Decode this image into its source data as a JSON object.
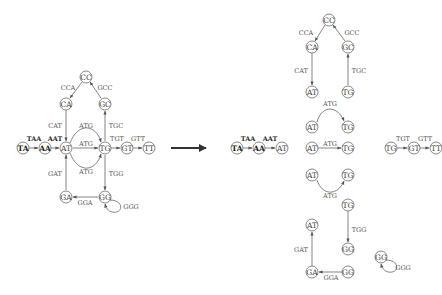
{
  "figure": {
    "type": "de Bruijn graph decomposition",
    "transform_arrow": "right-arrow"
  },
  "left_graph": {
    "nodes": [
      {
        "id": "TA",
        "label": "TA",
        "x": 23,
        "y": 148,
        "bold": true
      },
      {
        "id": "AA",
        "label": "AA",
        "x": 45,
        "y": 148,
        "bold": true
      },
      {
        "id": "AT",
        "label": "AT",
        "x": 66,
        "y": 148
      },
      {
        "id": "TG",
        "label": "TG",
        "x": 105,
        "y": 148
      },
      {
        "id": "GT",
        "label": "GT",
        "x": 127,
        "y": 148
      },
      {
        "id": "TT",
        "label": "TT",
        "x": 149,
        "y": 148
      },
      {
        "id": "CC",
        "label": "CC",
        "x": 86,
        "y": 77
      },
      {
        "id": "CA",
        "label": "CA",
        "x": 66,
        "y": 104
      },
      {
        "id": "GC",
        "label": "GC",
        "x": 105,
        "y": 104
      },
      {
        "id": "GA",
        "label": "GA",
        "x": 66,
        "y": 197
      },
      {
        "id": "GG",
        "label": "GG",
        "x": 105,
        "y": 197
      }
    ],
    "edges": [
      {
        "from": "TA",
        "to": "AA",
        "label": "TAA",
        "bold": true
      },
      {
        "from": "AA",
        "to": "AT",
        "label": "AAT",
        "bold": true
      },
      {
        "from": "AT",
        "to": "TG",
        "label": "ATG",
        "shape": "arc-top"
      },
      {
        "from": "AT",
        "to": "TG",
        "label": "ATG",
        "shape": "straight"
      },
      {
        "from": "AT",
        "to": "TG",
        "label": "ATG",
        "shape": "arc-bottom"
      },
      {
        "from": "TG",
        "to": "GT",
        "label": "TGT"
      },
      {
        "from": "GT",
        "to": "TT",
        "label": "GTT"
      },
      {
        "from": "CC",
        "to": "CA",
        "label": "CCA"
      },
      {
        "from": "GC",
        "to": "CC",
        "label": "GCC"
      },
      {
        "from": "CA",
        "to": "AT",
        "label": "CAT"
      },
      {
        "from": "TG",
        "to": "GC",
        "label": "TGC"
      },
      {
        "from": "TG",
        "to": "GG",
        "label": "TGG"
      },
      {
        "from": "GG",
        "to": "GA",
        "label": "GGA"
      },
      {
        "from": "GA",
        "to": "AT",
        "label": "GAT"
      },
      {
        "from": "GG",
        "to": "GG",
        "label": "GGG",
        "shape": "self-loop"
      }
    ]
  },
  "right_graph": {
    "components": [
      {
        "name": "cycle-cc",
        "nodes": [
          "CC",
          "CA",
          "GC",
          "AT",
          "TG"
        ],
        "edge_labels": [
          "CCA",
          "GCC",
          "CAT",
          "TGC"
        ]
      },
      {
        "name": "arc-top",
        "nodes": [
          "AT",
          "TG"
        ],
        "edge_labels": [
          "ATG"
        ]
      },
      {
        "name": "path-ta",
        "nodes": [
          "TA",
          "AA",
          "AT"
        ],
        "edge_labels": [
          "TAA",
          "AAT"
        ]
      },
      {
        "name": "straight",
        "nodes": [
          "AT",
          "TG"
        ],
        "edge_labels": [
          "ATG"
        ]
      },
      {
        "name": "path-tt",
        "nodes": [
          "TG",
          "GT",
          "TT"
        ],
        "edge_labels": [
          "TGT",
          "GTT"
        ]
      },
      {
        "name": "arc-bottom",
        "nodes": [
          "AT",
          "TG"
        ],
        "edge_labels": [
          "ATG"
        ]
      },
      {
        "name": "path-gg",
        "nodes": [
          "TG",
          "GG"
        ],
        "edge_labels": [
          "TGG"
        ]
      },
      {
        "name": "path-ga",
        "nodes": [
          "GG",
          "GA",
          "AT"
        ],
        "edge_labels": [
          "GGA",
          "GAT"
        ]
      },
      {
        "name": "loop-gg",
        "nodes": [
          "GG"
        ],
        "edge_labels": [
          "GGG"
        ]
      }
    ]
  },
  "labels": {
    "TAA": "TAA",
    "AAT": "AAT",
    "ATG": "ATG",
    "TGT": "TGT",
    "GTT": "GTT",
    "CCA": "CCA",
    "GCC": "GCC",
    "CAT": "CAT",
    "TGC": "TGC",
    "TGG": "TGG",
    "GGA": "GGA",
    "GAT": "GAT",
    "GGG": "GGG",
    "TA": "TA",
    "AA": "AA",
    "AT": "AT",
    "TG": "TG",
    "GT": "GT",
    "TT": "TT",
    "CC": "CC",
    "CA": "CA",
    "GC": "GC",
    "GA": "GA",
    "GG": "GG"
  }
}
